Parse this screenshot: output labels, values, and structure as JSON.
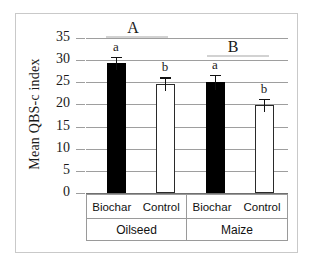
{
  "chart_data": {
    "type": "bar",
    "title": "",
    "xlabel": "",
    "ylabel": "Mean QBS-c index",
    "ylim": [
      0,
      35
    ],
    "ytick_labels": [
      "35",
      "30",
      "25",
      "20",
      "15",
      "10",
      "5",
      "0"
    ],
    "ytick_values": [
      35,
      30,
      25,
      20,
      15,
      10,
      5,
      0
    ],
    "grid": true,
    "legend": "none",
    "groups": [
      "Oilseed",
      "Maize"
    ],
    "group_labels": [
      "A",
      "B"
    ],
    "categories": [
      "Biochar",
      "Control",
      "Biochar",
      "Control"
    ],
    "series": [
      {
        "name": "Mean QBS-c index",
        "values": [
          29.3,
          24.6,
          25.0,
          19.8
        ],
        "errors": [
          1.5,
          1.5,
          1.7,
          1.5
        ],
        "fills": [
          "black",
          "white",
          "black",
          "white"
        ],
        "significance_letters": [
          "a",
          "b",
          "a",
          "b"
        ]
      }
    ],
    "bars": [
      {
        "group": "Oilseed",
        "treatment": "Biochar",
        "value": 29.3,
        "error": 1.5,
        "letter": "a",
        "fill": "black"
      },
      {
        "group": "Oilseed",
        "treatment": "Control",
        "value": 24.6,
        "error": 1.5,
        "letter": "b",
        "fill": "white"
      },
      {
        "group": "Maize",
        "treatment": "Biochar",
        "value": 25.0,
        "error": 1.7,
        "letter": "a",
        "fill": "black"
      },
      {
        "group": "Maize",
        "treatment": "Control",
        "value": 19.8,
        "error": 1.5,
        "letter": "b",
        "fill": "white"
      }
    ]
  },
  "axis": {
    "y_title": "Mean QBS-c index",
    "ticks": [
      "35",
      "30",
      "25",
      "20",
      "15",
      "10",
      "5",
      "0"
    ]
  },
  "xtable": {
    "treatments": [
      "Biochar",
      "Control",
      "Biochar",
      "Control"
    ],
    "crops": [
      "Oilseed",
      "Maize"
    ]
  },
  "annotations": {
    "group_a": "A",
    "group_b": "B",
    "bar_letters": [
      "a",
      "b",
      "a",
      "b"
    ]
  },
  "colors": {
    "bar_black": "#000000",
    "bar_white": "#ffffff",
    "bar_outline": "#2a2a2a",
    "gridline": "#9e9e9e",
    "frame": "#c9c9c9",
    "text": "#1a1a1a"
  }
}
